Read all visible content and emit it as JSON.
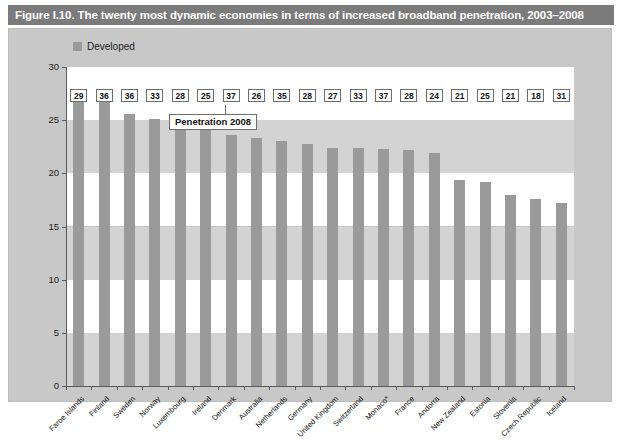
{
  "figure": {
    "title": "Figure I.10. The twenty most dynamic economies in terms of increased broadband penetration, 2003–2008",
    "legend_label": "Developed",
    "legend_swatch_color": "#9a9a9a",
    "callout_label": "Penetration 2008",
    "bar_color": "#9a9a9a",
    "title_bar_color": "#7b7b7b",
    "panel_color": "#c8c8c8"
  },
  "chart_data": {
    "type": "bar",
    "title": "Figure I.10. The twenty most dynamic economies in terms of increased broadband penetration, 2003–2008",
    "xlabel": "",
    "ylabel": "",
    "ylim": [
      0,
      30
    ],
    "yticks": [
      0,
      5,
      10,
      15,
      20,
      25,
      30
    ],
    "ytick_labels": [
      "0",
      "5",
      "10",
      "15",
      "20",
      "25",
      "30"
    ],
    "grid": "horizontal-bands",
    "legend_position": "top-left",
    "series": [
      {
        "name": "Developed",
        "values": [
          27.3,
          27.3,
          25.6,
          25.1,
          24.9,
          24.3,
          23.6,
          23.3,
          23.0,
          22.8,
          22.4,
          22.4,
          22.3,
          22.2,
          21.9,
          19.4,
          19.2,
          18.0,
          17.6,
          17.2
        ]
      }
    ],
    "categories": [
      "Faroe Islands",
      "Finland",
      "Sweden",
      "Norway",
      "Luxembourg",
      "Ireland",
      "Denmark",
      "Australia",
      "Netherlands",
      "Germany",
      "United Kingdom",
      "Switzerland",
      "Monaco*",
      "France",
      "Andorra",
      "New Zealand",
      "Estonia",
      "Slovenia",
      "Czech Republic",
      "Iceland"
    ],
    "data_labels": [
      29,
      36,
      36,
      33,
      28,
      25,
      37,
      26,
      35,
      28,
      27,
      33,
      37,
      28,
      24,
      21,
      25,
      21,
      18,
      31
    ],
    "data_labels_note": "Penetration 2008",
    "annotations": [
      "Penetration 2008"
    ]
  }
}
